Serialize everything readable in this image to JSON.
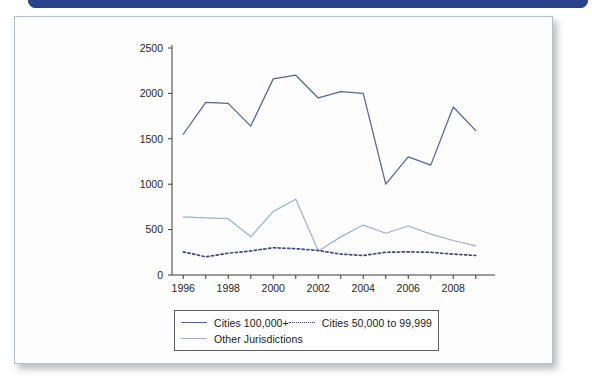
{
  "banner": {
    "name": "top-blue-banner"
  },
  "chart_data": {
    "type": "line",
    "title": "",
    "subtitle": "",
    "xlabel": "",
    "ylabel": "",
    "x": [
      1996,
      1997,
      1998,
      1999,
      2000,
      2001,
      2002,
      2003,
      2004,
      2005,
      2006,
      2007,
      2008,
      2009
    ],
    "xlim": [
      1995.5,
      2009.5
    ],
    "ylim": [
      0,
      2500
    ],
    "yticks": [
      0,
      500,
      1000,
      1500,
      2000,
      2500
    ],
    "ytick_labels": [
      "0",
      "500",
      "1000",
      "1500",
      "2000",
      "2500"
    ],
    "xticks": [
      1996,
      1997,
      1998,
      1999,
      2000,
      2001,
      2002,
      2003,
      2004,
      2005,
      2006,
      2007,
      2008,
      2009
    ],
    "xtick_labels": [
      "1996",
      "",
      "1998",
      "",
      "2000",
      "",
      "2002",
      "",
      "2004",
      "",
      "2006",
      "",
      "2008",
      ""
    ],
    "xtick_labels_shown": [
      "1996",
      "1998",
      "2000",
      "2002",
      "2004",
      "2006",
      "2008"
    ],
    "grid": false,
    "legend_position": "below-plot",
    "series": [
      {
        "name": "Cities 100,000+",
        "style": "solid",
        "color": "#54659c",
        "values": [
          1550,
          1900,
          1890,
          1640,
          2160,
          2200,
          1950,
          2020,
          2000,
          1000,
          1300,
          1210,
          1850,
          1590
        ]
      },
      {
        "name": "Cities 50,000 to 99,999",
        "style": "dotted",
        "color": "#3c4a86",
        "values": [
          255,
          200,
          240,
          265,
          300,
          290,
          270,
          230,
          215,
          250,
          255,
          250,
          230,
          215
        ]
      },
      {
        "name": "Other Jurisdictions",
        "style": "solid",
        "color": "#9fb1d4",
        "values": [
          640,
          630,
          620,
          420,
          700,
          835,
          265,
          420,
          550,
          460,
          540,
          450,
          380,
          320
        ]
      }
    ]
  },
  "legend": {
    "entries": [
      {
        "label": "Cities 100,000+",
        "swatch": "solid-dark"
      },
      {
        "label": "Cities 50,000 to 99,999",
        "swatch": "dotted"
      },
      {
        "label": "Other Jurisdictions",
        "swatch": "solid-light"
      }
    ]
  }
}
